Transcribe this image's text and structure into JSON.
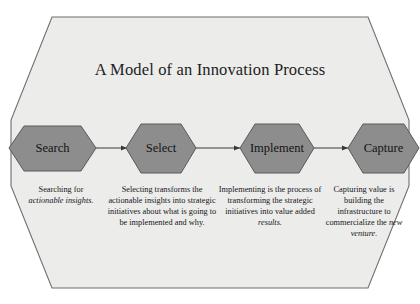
{
  "diagram": {
    "title": "A Model of an Innovation Process",
    "frame_fill": "#ececea",
    "frame_stroke": "#6e6e6e",
    "node_fill": "#8d8d8d",
    "node_stroke": "#5a5a5a",
    "arrow_color": "#3a3a3a",
    "text_color": "#161616"
  },
  "stages": [
    {
      "id": "search",
      "label": "Search",
      "caption_plain_1": "Searching for",
      "caption_italic_1": "actionable insights."
    },
    {
      "id": "select",
      "label": "Select",
      "caption_plain_1": "Selecting transforms the actionable insights into strategic initiatives about what is going to be implemented and why."
    },
    {
      "id": "implement",
      "label": "Implement",
      "caption_plain_1": "Implementing is the process of transforming the strategic initiatives into value added",
      "caption_italic_1": "results."
    },
    {
      "id": "capture",
      "label": "Capture",
      "caption_plain_1": "Capturing value is building the infrastructure to commercialize the",
      "caption_italic_1": "new venture."
    }
  ],
  "arrows": [
    {
      "id": "arrow-search-select",
      "from": "search",
      "to": "select"
    },
    {
      "id": "arrow-select-implement",
      "from": "select",
      "to": "implement"
    },
    {
      "id": "arrow-implement-capture",
      "from": "implement",
      "to": "capture"
    }
  ]
}
